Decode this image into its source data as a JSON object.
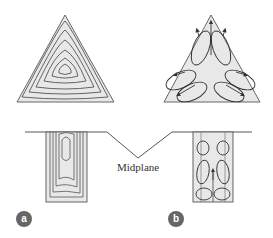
{
  "diagram": {
    "labels": {
      "midplane": "Midplane",
      "panel_a": "a",
      "panel_b": "b"
    },
    "colors": {
      "fill": "#e6e6e6",
      "stroke": "#555555",
      "badge": "#666666"
    },
    "panels": [
      {
        "id": "a",
        "top": "triangle with nested closed streamlines",
        "bottom": "rectangle cross-section with nested streamlines"
      },
      {
        "id": "b",
        "top": "triangle with six recirculation vortices and arrows",
        "bottom": "rectangle cross-section with six vortices"
      }
    ]
  }
}
